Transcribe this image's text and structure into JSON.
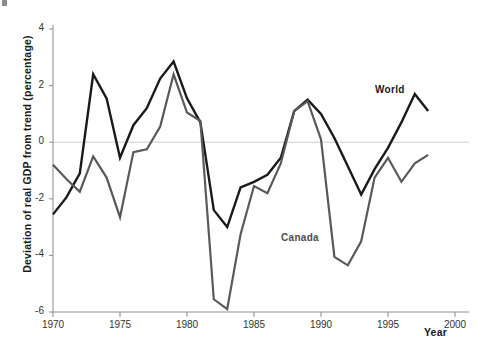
{
  "chart_data": {
    "type": "line",
    "title": "",
    "subtitle": "",
    "xlabel": "Year",
    "ylabel": "Deviation of real GDP from trend (percentage)",
    "xlim": [
      1970,
      2000
    ],
    "ylim": [
      -6,
      4
    ],
    "xticks": [
      1970,
      1975,
      1980,
      1985,
      1990,
      1995,
      2000
    ],
    "xtick_labels": [
      "1970",
      "1975",
      "1980",
      "1985",
      "1990",
      "1995",
      "2000"
    ],
    "yticks": [
      4,
      2,
      0,
      -2,
      -4,
      -6
    ],
    "ytick_labels": [
      "4",
      "2",
      "0",
      "-2",
      "-4",
      "-6"
    ],
    "grid": false,
    "zero_line": true,
    "zero_line_color": "#cccccc",
    "legend_position": "inline-annotations",
    "x": [
      1970,
      1971,
      1972,
      1973,
      1974,
      1975,
      1976,
      1977,
      1978,
      1979,
      1980,
      1981,
      1982,
      1983,
      1984,
      1985,
      1986,
      1987,
      1988,
      1989,
      1990,
      1991,
      1992,
      1993,
      1994,
      1995,
      1996,
      1997,
      1998
    ],
    "series": [
      {
        "name": "World",
        "color": "#1a1a1a",
        "label_text": "World",
        "values": [
          -2.55,
          -1.95,
          -1.1,
          2.4,
          1.55,
          -0.55,
          0.6,
          1.2,
          2.25,
          2.85,
          1.55,
          0.7,
          -2.4,
          -3.0,
          -1.6,
          -1.4,
          -1.15,
          -0.55,
          1.1,
          1.5,
          1.0,
          0.15,
          -0.85,
          -1.85,
          -0.95,
          -0.2,
          0.7,
          1.7,
          1.1
        ]
      },
      {
        "name": "Canada",
        "color": "#595959",
        "label_text": "Canada",
        "values": [
          -0.8,
          -1.3,
          -1.75,
          -0.5,
          -1.25,
          -2.65,
          -0.35,
          -0.25,
          0.55,
          2.4,
          1.05,
          0.75,
          -5.55,
          -5.9,
          -3.25,
          -1.55,
          -1.8,
          -0.75,
          1.1,
          1.45,
          0.1,
          -4.05,
          -4.35,
          -3.5,
          -1.25,
          -0.55,
          -1.4,
          -0.75,
          -0.45
        ]
      }
    ]
  },
  "axis": {
    "year_label": "Year"
  }
}
